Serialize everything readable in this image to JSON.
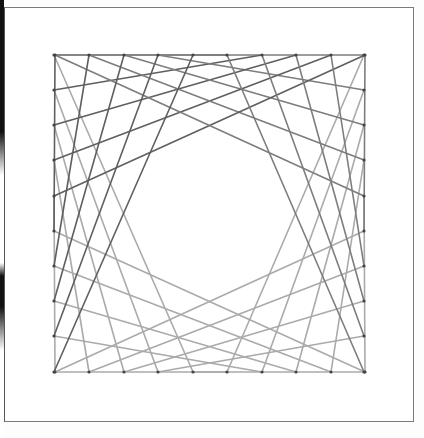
{
  "artwork": {
    "type": "string-art",
    "description": "Nails around a square connected by threads, forming four curved envelopes around a rounded central void",
    "colors": {
      "background": "#ffffff",
      "frame": "#7a7a7a",
      "thread_upper": "#5f5f5f",
      "thread_lower": "#aaaaaa",
      "nail": "#444444"
    },
    "grid": {
      "left_x": 54,
      "right_x": 364,
      "top_y": 55,
      "bottom_y": 372,
      "x_positions": [
        55,
        89,
        124,
        158,
        193,
        227,
        262,
        296,
        331,
        365
      ],
      "y_positions": [
        55,
        90,
        125,
        160,
        196,
        231,
        266,
        301,
        336,
        372
      ]
    },
    "connection_rule": "left[i] -> top[(i+5) mod 10], mirrored for all four quadrants"
  }
}
